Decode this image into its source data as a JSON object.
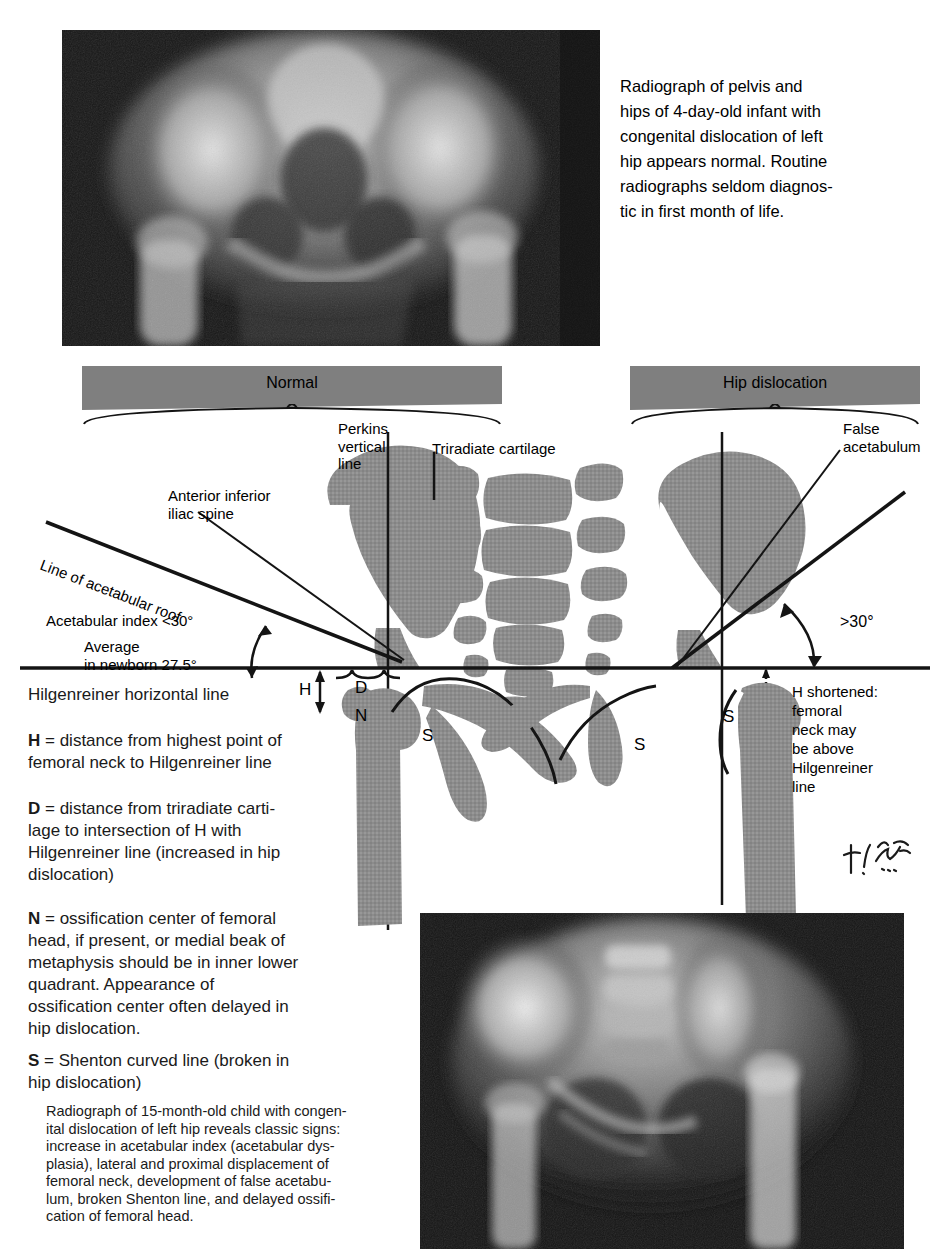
{
  "figure": {
    "panels": {
      "normal_banner": "Normal",
      "dislocation_banner": "Hip dislocation"
    }
  },
  "top_radiograph": {
    "caption_lines": [
      "Radiograph of pelvis and",
      "hips of 4-day-old infant with",
      "congenital dislocation of left",
      "hip appears normal.  Routine",
      "radiographs seldom diagnos-",
      "tic in first month of life."
    ]
  },
  "diagram_labels": {
    "perkins_line": [
      "Perkins",
      "vertical",
      "line"
    ],
    "triradiate_cartilage": "Triradiate cartilage",
    "false_acetabulum": [
      "False",
      "acetabulum"
    ],
    "anterior_inferior_iliac_spine": [
      "Anterior inferior",
      "iliac spine"
    ],
    "line_of_acetabular_roof": "Line of acetabular roof",
    "acetabular_index": "Acetabular index <30°",
    "average_newborn": [
      "Average",
      "in newborn 27.5°"
    ],
    "angle_dislocated": ">30°",
    "h_shortened": [
      "H shortened:",
      "femoral",
      "neck may",
      "be above",
      "Hilgenreiner",
      "line"
    ],
    "markers": {
      "h": "H",
      "d": "D",
      "n": "N",
      "s_normal": "S",
      "s_mid": "S",
      "s_dislocated": "S"
    }
  },
  "legend": {
    "hilgenreiner_title": "Hilgenreiner horizontal line",
    "entries": [
      {
        "key": "H",
        "text": " = distance from highest point of femoral neck to Hilgenreiner line"
      },
      {
        "key": "D",
        "text": " = distance from triradiate carti-lage to intersection of H with Hilgenreiner line (increased in hip dislocation)"
      },
      {
        "key": "N",
        "text": " = ossification center of femoral head, if present, or medial beak of metaphysis should be in inner lower quadrant.  Appearance of ossification center often delayed in hip dislocation."
      },
      {
        "key": "S",
        "text": " = Shenton curved line (broken in hip dislocation)"
      }
    ],
    "entry_lines": {
      "H": [
        "distance from highest point of",
        "femoral neck to Hilgenreiner line"
      ],
      "D": [
        "distance from triradiate carti-",
        "lage to intersection of H with",
        "Hilgenreiner line (increased in hip",
        "dislocation)"
      ],
      "N": [
        "ossification center of femoral",
        "head, if present, or medial beak of",
        "metaphysis should be in inner lower",
        "quadrant.  Appearance of",
        "ossification center often delayed in",
        "hip dislocation."
      ],
      "S": [
        "Shenton curved line (broken in",
        "hip dislocation)"
      ]
    },
    "equals": " = "
  },
  "bottom_radiograph": {
    "caption_lines": [
      "Radiograph of 15-month-old child with congen-",
      "ital dislocation of left hip reveals classic signs:",
      "increase in acetabular index (acetabular dys-",
      "plasia), lateral and proximal displacement of",
      "femoral neck, development of false acetabu-",
      "lum, broken Shenton line, and delayed ossifi-",
      "cation of femoral head."
    ]
  },
  "signature": "artist-signature",
  "colors": {
    "bone_gray": "#8c8c8c",
    "banner_gray": "#7f7f7f",
    "line_black": "#141414",
    "text": "#1a1a1a",
    "radiograph_dark": "#1b1b1b"
  }
}
